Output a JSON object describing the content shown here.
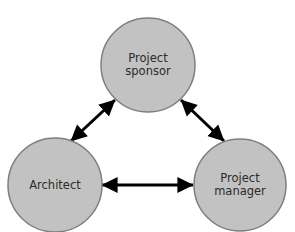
{
  "diagram": {
    "type": "triangle-relationship",
    "background_color": "#ffffff",
    "node_fill_color": "#c2c2c2",
    "node_border_color": "#7f7f7f",
    "label_color": "#2b2b2b",
    "connector_color": "#000000",
    "nodes": [
      {
        "id": "project-sponsor",
        "label_lines": [
          "Project",
          "sponsor"
        ],
        "label_full": "Project sponsor",
        "cx": 148,
        "cy": 65,
        "r": 47
      },
      {
        "id": "architect",
        "label_lines": [
          "Architect"
        ],
        "label_full": "Architect",
        "cx": 55,
        "cy": 185,
        "r": 47
      },
      {
        "id": "project-manager",
        "label_lines": [
          "Project",
          "manager"
        ],
        "label_full": "Project manager",
        "cx": 240,
        "cy": 185,
        "r": 46
      }
    ],
    "connectors": [
      {
        "id": "architect-to-sponsor",
        "from": "architect",
        "to": "project-sponsor",
        "direction": "both",
        "x1": 71,
        "y1": 141,
        "x2": 115,
        "y2": 100
      },
      {
        "id": "sponsor-to-manager",
        "from": "project-sponsor",
        "to": "project-manager",
        "direction": "both",
        "x1": 181,
        "y1": 100,
        "x2": 224,
        "y2": 141
      },
      {
        "id": "architect-to-manager",
        "from": "architect",
        "to": "project-manager",
        "direction": "both",
        "x1": 102,
        "y1": 185,
        "x2": 193,
        "y2": 185
      }
    ]
  }
}
